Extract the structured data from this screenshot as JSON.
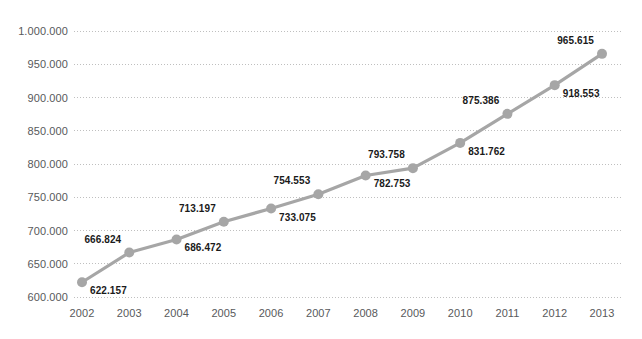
{
  "chart_data": {
    "type": "line",
    "title": "",
    "subtitle": "",
    "xlabel": "",
    "ylabel": "",
    "categories": [
      "2002",
      "2003",
      "2004",
      "2005",
      "2006",
      "2007",
      "2008",
      "2009",
      "2010",
      "2011",
      "2012",
      "2013"
    ],
    "values": [
      622157,
      666824,
      686472,
      713197,
      733075,
      754553,
      782753,
      793758,
      831762,
      875386,
      918553,
      965615
    ],
    "point_labels": [
      "622.157",
      "666.824",
      "686.472",
      "713.197",
      "733.075",
      "754.553",
      "782.753",
      "793.758",
      "831.762",
      "875.386",
      "918.553",
      "965.615"
    ],
    "point_label_position": [
      "below",
      "above",
      "below",
      "above",
      "below",
      "above",
      "below",
      "above",
      "below",
      "above",
      "below",
      "above"
    ],
    "ylim": [
      600000,
      1000000
    ],
    "yticks": [
      600000,
      650000,
      700000,
      750000,
      800000,
      850000,
      900000,
      950000,
      1000000
    ],
    "ytick_labels": [
      "600.000",
      "650.000",
      "700.000",
      "750.000",
      "800.000",
      "850.000",
      "900.000",
      "950.000",
      "1.000.000"
    ],
    "grid": true,
    "grid_style": "dotted",
    "legend": false,
    "legend_position": "none",
    "series": [
      {
        "name": "",
        "values": [
          622157,
          666824,
          686472,
          713197,
          733075,
          754553,
          782753,
          793758,
          831762,
          875386,
          918553,
          965615
        ]
      }
    ]
  },
  "style": {
    "line_color": "#a6a6a6",
    "marker_color": "#a6a6a6",
    "grid_color": "#bfbfbf",
    "tick_text_color": "#58595b",
    "label_text_color": "#1a1a1a",
    "background": "#ffffff"
  }
}
